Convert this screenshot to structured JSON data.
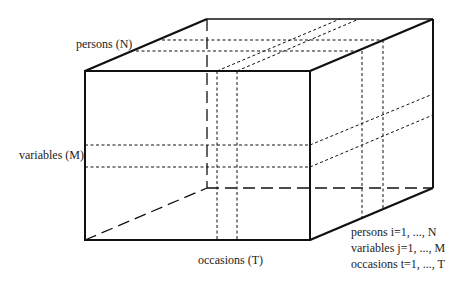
{
  "diagram": {
    "type": "data-cube",
    "axis_labels": {
      "persons": "persons (N)",
      "variables": "variables (M)",
      "occasions": "occasions (T)"
    },
    "legend": [
      "persons i=1, ..., N",
      "variables j=1, ..., M",
      "occasions t=1, ..., T"
    ],
    "colors": {
      "line": "#111111",
      "background": "#ffffff"
    }
  }
}
